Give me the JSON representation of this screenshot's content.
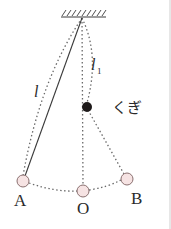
{
  "diagram": {
    "title": "",
    "labels": {
      "length_full": "l",
      "length_short": "l",
      "length_short_sub": "1",
      "nail": "くぎ",
      "point_a": "A",
      "point_o": "O",
      "point_b": "B"
    },
    "colors": {
      "line": "#3a3a3a",
      "dotted": "#6a6a6a",
      "ball_fill": "#f6e3e3",
      "ball_stroke": "#8a7070",
      "nail": "#1e1a1a",
      "border": "#c8c8c8"
    }
  }
}
